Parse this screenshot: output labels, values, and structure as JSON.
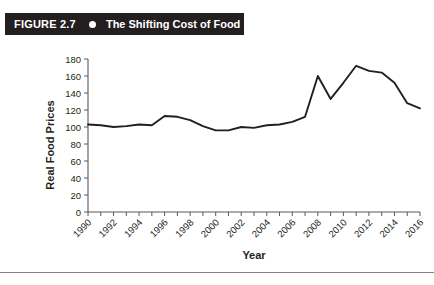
{
  "banner": {
    "figure_number": "FIGURE 2.7",
    "bullet_icon": "bullet-dot",
    "title": "The Shifting Cost of Food",
    "background_color": "#231f20",
    "text_color": "#ffffff"
  },
  "chart_data": {
    "type": "line",
    "title": "The Shifting Cost of Food",
    "xlabel": "Year",
    "ylabel": "Real Food Prices",
    "xlim": [
      1990,
      2016
    ],
    "ylim": [
      0,
      180
    ],
    "ytick_values": [
      0,
      20,
      40,
      60,
      80,
      100,
      120,
      140,
      160,
      180
    ],
    "ytick_labels": [
      "0",
      "20",
      "40",
      "60",
      "80",
      "100",
      "120",
      "140",
      "160",
      "180"
    ],
    "xtick_values": [
      1990,
      1991,
      1992,
      1993,
      1994,
      1995,
      1996,
      1997,
      1998,
      1999,
      2000,
      2001,
      2002,
      2003,
      2004,
      2005,
      2006,
      2007,
      2008,
      2009,
      2010,
      2011,
      2012,
      2013,
      2014,
      2015,
      2016
    ],
    "xtick_labels_shown": [
      "1990",
      "1992",
      "1994",
      "1996",
      "1998",
      "2000",
      "2002",
      "2004",
      "2006",
      "2008",
      "2010",
      "2012",
      "2014",
      "2016"
    ],
    "xtick_label_rotation": -45,
    "grid": false,
    "legend": false,
    "line_color": "#231f20",
    "x": [
      1990,
      1991,
      1992,
      1993,
      1994,
      1995,
      1996,
      1997,
      1998,
      1999,
      2000,
      2001,
      2002,
      2003,
      2004,
      2005,
      2006,
      2007,
      2008,
      2009,
      2010,
      2011,
      2012,
      2013,
      2014,
      2015,
      2016
    ],
    "values": [
      103,
      102,
      100,
      101,
      103,
      102,
      113,
      112,
      108,
      101,
      96,
      96,
      100,
      99,
      102,
      103,
      106,
      112,
      160,
      133,
      152,
      172,
      166,
      164,
      152,
      128,
      122
    ],
    "series": [
      {
        "name": "Real Food Prices",
        "values": [
          103,
          102,
          100,
          101,
          103,
          102,
          113,
          112,
          108,
          101,
          96,
          96,
          100,
          99,
          102,
          103,
          106,
          112,
          160,
          133,
          152,
          172,
          166,
          164,
          152,
          128,
          122
        ]
      }
    ]
  }
}
